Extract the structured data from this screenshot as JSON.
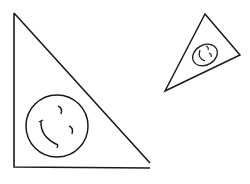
{
  "diagram": {
    "background": "#ffffff",
    "stroke": "#1a1a1a",
    "shapes": [
      {
        "name": "large-triangle",
        "points": "14,13 14,167 150,168 150,163",
        "face": {
          "cx": 55,
          "cy": 125,
          "r": 31
        }
      },
      {
        "name": "small-triangle",
        "points": "205,14 240,55 165,91",
        "face": {
          "cx": 205,
          "cy": 55,
          "rx": 13,
          "ry": 17
        }
      }
    ]
  }
}
